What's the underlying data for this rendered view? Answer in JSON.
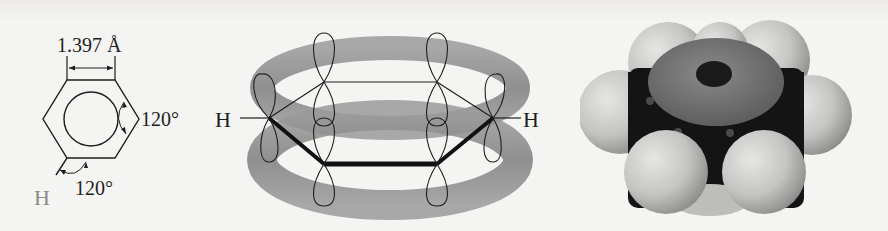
{
  "figure": {
    "panels": [
      {
        "id": "bond-geometry",
        "bond_length_label": "1.397 Å",
        "ring_angle_label": "120°",
        "h_angle_label": "120°",
        "hydrogen_label": "H"
      },
      {
        "id": "pi-orbital-overlap",
        "left_hydrogen_label": "H",
        "right_hydrogen_label": "H"
      },
      {
        "id": "space-filling-model"
      }
    ]
  },
  "colors": {
    "background": "#f4f4f2",
    "line": "#1e1e1e",
    "hydrogen_text": "#8a8a8a",
    "torus": "#8c8c8c",
    "carbon_core": "#141414",
    "hydrogen_sphere": "#c8c8c6"
  }
}
